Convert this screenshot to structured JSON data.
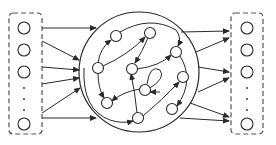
{
  "diagram": {
    "type": "reservoir-computing-network",
    "colors": {
      "stroke": "#2a2a2a",
      "dashed_box": "#555555",
      "background": "#ffffff"
    },
    "input_layer": {
      "box": {
        "x": 9,
        "y": 13,
        "w": 33,
        "h": 121
      },
      "nodes": [
        {
          "id": "in1",
          "x": 24,
          "y": 28
        },
        {
          "id": "in2",
          "x": 24,
          "y": 50
        },
        {
          "id": "in3",
          "x": 24,
          "y": 72
        },
        {
          "id": "in4",
          "x": 24,
          "y": 124
        }
      ],
      "ellipsis_dots": [
        {
          "x": 24,
          "y": 88
        },
        {
          "x": 24,
          "y": 99
        },
        {
          "x": 24,
          "y": 110
        }
      ]
    },
    "output_layer": {
      "box": {
        "x": 231,
        "y": 13,
        "w": 32,
        "h": 121
      },
      "nodes": [
        {
          "id": "out1",
          "x": 247,
          "y": 28
        },
        {
          "id": "out2",
          "x": 247,
          "y": 50
        },
        {
          "id": "out3",
          "x": 247,
          "y": 72
        },
        {
          "id": "out4",
          "x": 247,
          "y": 124
        }
      ],
      "ellipsis_dots": [
        {
          "x": 247,
          "y": 88
        },
        {
          "x": 247,
          "y": 99
        },
        {
          "x": 247,
          "y": 110
        }
      ]
    },
    "reservoir": {
      "circle": {
        "cx": 139,
        "cy": 72,
        "r": 60
      },
      "nodes": [
        {
          "id": "A",
          "x": 116,
          "y": 36
        },
        {
          "id": "B",
          "x": 150,
          "y": 33
        },
        {
          "id": "C",
          "x": 98,
          "y": 68
        },
        {
          "id": "D",
          "x": 132,
          "y": 69
        },
        {
          "id": "E",
          "x": 176,
          "y": 52
        },
        {
          "id": "F",
          "x": 145,
          "y": 90
        },
        {
          "id": "G",
          "x": 183,
          "y": 77
        },
        {
          "id": "H",
          "x": 107,
          "y": 103
        },
        {
          "id": "I",
          "x": 138,
          "y": 118
        },
        {
          "id": "J",
          "x": 172,
          "y": 109
        }
      ],
      "edges": [
        {
          "d": "M 98 63 Q 100 48 111 40",
          "label": "C-to-A"
        },
        {
          "d": "M 103 66 Q 128 55 145 37",
          "label": "C-to-B"
        },
        {
          "d": "M 120 32 Q 150 15 176 30 Q 182 38 178 46",
          "label": "A-to-E"
        },
        {
          "d": "M 148 38 Q 142 52 135 63",
          "label": "B-to-D"
        },
        {
          "d": "M 98 73 Q 98 88 104 98",
          "label": "C-to-H"
        },
        {
          "d": "M 140 89 Q 122 92 112 101",
          "label": "F-to-H"
        },
        {
          "d": "M 137 113 Q 135 92 131 74",
          "label": "I-to-D"
        },
        {
          "d": "M 150 88 Q 166 78 160 70 Q 150 64 147 84 M 160 92 L 150 92",
          "label": "F-self-loop"
        },
        {
          "d": "M 143 116 Q 162 100 179 82",
          "label": "I-to-G"
        },
        {
          "d": "M 137 69 Q 160 66 171 55",
          "label": "D-to-E"
        },
        {
          "d": "M 180 56 Q 195 80 177 106",
          "label": "E-to-J"
        },
        {
          "d": "M 84 68 Q 82 110 110 120 Q 122 124 133 121",
          "label": "left-arc-to-I"
        }
      ]
    },
    "input_edges": [
      {
        "x1": 42,
        "y1": 28,
        "x2": 96,
        "y2": 28
      },
      {
        "x1": 42,
        "y1": 41,
        "x2": 79,
        "y2": 60
      },
      {
        "x1": 42,
        "y1": 67,
        "x2": 79,
        "y2": 70
      },
      {
        "x1": 42,
        "y1": 84,
        "x2": 79,
        "y2": 78
      },
      {
        "x1": 42,
        "y1": 113,
        "x2": 80,
        "y2": 88
      },
      {
        "x1": 42,
        "y1": 118,
        "x2": 96,
        "y2": 118
      }
    ],
    "output_edges": [
      {
        "x1": 181,
        "y1": 32,
        "x2": 229,
        "y2": 31
      },
      {
        "x1": 196,
        "y1": 52,
        "x2": 229,
        "y2": 38
      },
      {
        "x1": 198,
        "y1": 67,
        "x2": 229,
        "y2": 72
      },
      {
        "x1": 198,
        "y1": 92,
        "x2": 229,
        "y2": 78
      },
      {
        "x1": 190,
        "y1": 103,
        "x2": 229,
        "y2": 117
      },
      {
        "x1": 180,
        "y1": 118,
        "x2": 229,
        "y2": 121
      }
    ]
  }
}
